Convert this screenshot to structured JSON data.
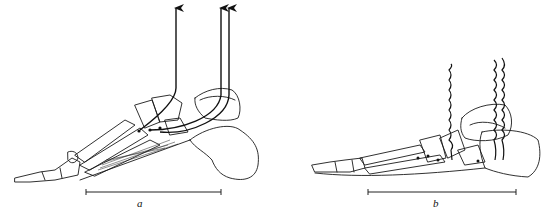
{
  "figure": {
    "panels": [
      {
        "id": "a",
        "label": "a",
        "tendon_state": "taut (arrows pulling up)",
        "scale_bar": {
          "x1": 86,
          "x2": 221,
          "y": 192
        },
        "label_pos": {
          "x": 137,
          "y": 203
        }
      },
      {
        "id": "b",
        "label": "b",
        "tendon_state": "slack (wavy lines)",
        "scale_bar": {
          "x1": 368,
          "x2": 516,
          "y": 192
        },
        "label_pos": {
          "x": 433,
          "y": 203
        }
      }
    ],
    "colors": {
      "line": "#111111",
      "background": "#ffffff"
    }
  }
}
